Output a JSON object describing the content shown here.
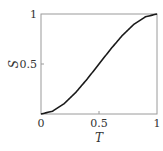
{
  "chart_data": {
    "type": "line",
    "title": "",
    "xlabel": "T",
    "ylabel": "S",
    "xlim": [
      0,
      1
    ],
    "ylim": [
      0,
      1
    ],
    "grid": false,
    "legend": null,
    "x_ticks": [
      "0",
      "0.5",
      "1"
    ],
    "y_ticks": [
      "0.5",
      "1"
    ],
    "series": [
      {
        "name": "S(T)",
        "color": "#1a1a1a",
        "x": [
          0,
          0.1,
          0.2,
          0.3,
          0.4,
          0.5,
          0.6,
          0.7,
          0.8,
          0.9,
          1.0
        ],
        "y": [
          0,
          0.028,
          0.104,
          0.216,
          0.352,
          0.5,
          0.648,
          0.784,
          0.896,
          0.972,
          1.0
        ]
      }
    ]
  },
  "labels": {
    "x_axis": "T",
    "y_axis": "S",
    "x_tick_0": "0",
    "x_tick_05": "0.5",
    "x_tick_1": "1",
    "y_tick_05": "0.5",
    "y_tick_1": "1"
  }
}
